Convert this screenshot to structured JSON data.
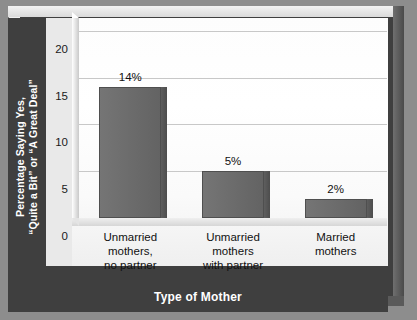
{
  "chart_data": {
    "type": "bar",
    "title": "",
    "subtitle": "",
    "xlabel": "Type of Mother",
    "ylabel_lines": [
      "Percentage Saying Yes,",
      "“Quite a Bit” or “A Great Deal”"
    ],
    "ylabel": "Percentage Saying Yes, “Quite a Bit” or “A Great Deal”",
    "categories": [
      "Unmarried mothers, no partner",
      "Unmarried mothers with partner",
      "Married mothers"
    ],
    "category_lines": [
      [
        "Unmarried",
        "mothers,",
        "no partner"
      ],
      [
        "Unmarried",
        "mothers",
        "with partner"
      ],
      [
        "Married",
        "mothers"
      ]
    ],
    "values": [
      14,
      5,
      2
    ],
    "data_labels": [
      "14%",
      "5%",
      "2%"
    ],
    "ylim": [
      0,
      22
    ],
    "yticks": [
      0,
      5,
      10,
      15,
      20
    ],
    "ytick_labels": [
      "0",
      "5",
      "10",
      "15",
      "20"
    ],
    "grid": true,
    "grid_axis": "y",
    "legend": false,
    "legend_position": "none"
  },
  "colors": {
    "page_background": "#8d8d8d",
    "frame_band": "#3f3f3f",
    "plot_background": "#fdfdfd",
    "bar_fill": "#6b6b6b",
    "bar_edge": "#4f4f4f",
    "gridline": "#c8c8c8",
    "axis_title_text": "#ffffff",
    "tick_text": "#1a1a1a"
  }
}
